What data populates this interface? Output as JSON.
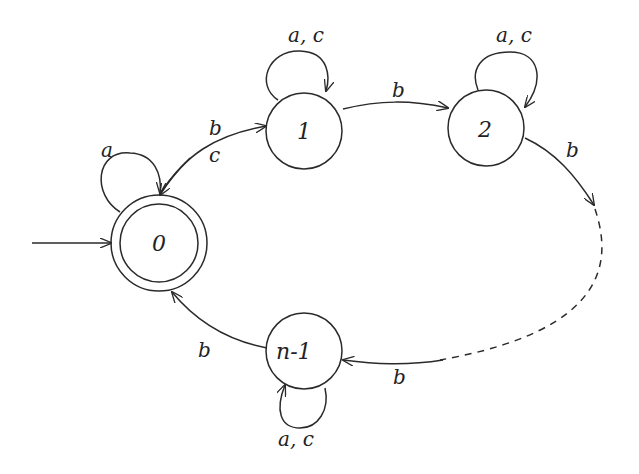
{
  "diagram": {
    "type": "finite-automaton",
    "colors": {
      "stroke": "#2a2a2a",
      "background": "#ffffff"
    },
    "states": [
      {
        "id": "0",
        "label": "0",
        "initial": true,
        "accepting": true
      },
      {
        "id": "1",
        "label": "1",
        "initial": false,
        "accepting": false
      },
      {
        "id": "2",
        "label": "2",
        "initial": false,
        "accepting": false
      },
      {
        "id": "n-1",
        "label": "n-1",
        "initial": false,
        "accepting": false
      }
    ],
    "transitions": [
      {
        "from": "0",
        "to": "0",
        "label": "a"
      },
      {
        "from": "0",
        "to": "1",
        "label": "b"
      },
      {
        "from": "1",
        "to": "0",
        "label": "c"
      },
      {
        "from": "1",
        "to": "1",
        "label": "a, c"
      },
      {
        "from": "1",
        "to": "2",
        "label": "b"
      },
      {
        "from": "2",
        "to": "2",
        "label": "a, c"
      },
      {
        "from": "2",
        "to": "…",
        "label": "b",
        "dashed_continuation": true
      },
      {
        "from": "…",
        "to": "n-1",
        "label": "b"
      },
      {
        "from": "n-1",
        "to": "n-1",
        "label": "a, c"
      },
      {
        "from": "n-1",
        "to": "0",
        "label": "b"
      }
    ],
    "labels": {
      "s0": "0",
      "s1": "1",
      "s2": "2",
      "sn1": "n-1",
      "loop0": "a",
      "e01": "b",
      "e10": "c",
      "loop1": "a, c",
      "e12": "b",
      "loop2": "a, c",
      "e2dots": "b",
      "edotsn1": "b",
      "loopn1": "a, c",
      "en10": "b"
    }
  }
}
